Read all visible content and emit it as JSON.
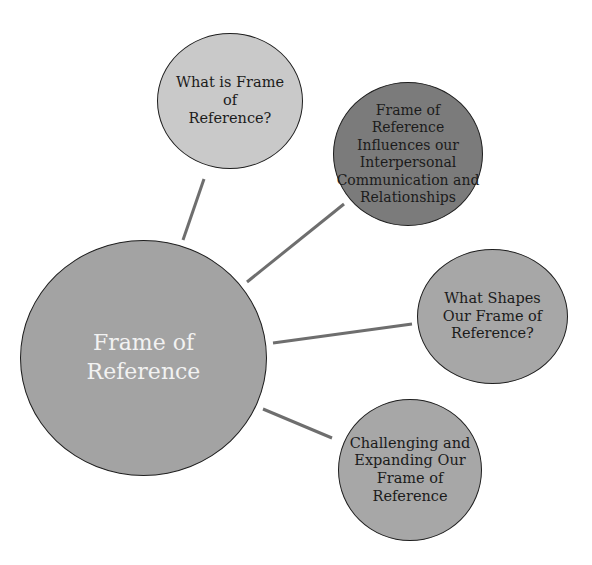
{
  "diagram": {
    "type": "mind-map",
    "center": {
      "label": "Frame of Reference",
      "lines": [
        "Frame of",
        "Reference"
      ],
      "fill": "#a3a3a3",
      "text_color": "#f2f2f2"
    },
    "branches": [
      {
        "id": 1,
        "label": "What is  Frame of Reference?",
        "lines": [
          "What is  Frame of",
          "Reference?"
        ],
        "fill": "#c9c9c9"
      },
      {
        "id": 2,
        "label": "Frame of Reference Influences our Interpersonal Communication and Relationships",
        "lines": [
          "Frame of",
          "Reference",
          "Influences our",
          "Interpersonal",
          "Communication and",
          "Relationships"
        ],
        "fill": "#7b7b7b"
      },
      {
        "id": 3,
        "label": "What Shapes Our Frame of Reference?",
        "lines": [
          "What Shapes",
          "Our Frame of",
          "Reference?"
        ],
        "fill": "#a7a7a7"
      },
      {
        "id": 4,
        "label": "Challenging and Expanding Our Frame of Reference",
        "lines": [
          "Challenging and",
          "Expanding Our",
          "Frame of",
          "Reference"
        ],
        "fill": "#a7a7a7"
      }
    ],
    "connector_color": "#6e6e6e",
    "border_color": "#1e1e1e"
  }
}
